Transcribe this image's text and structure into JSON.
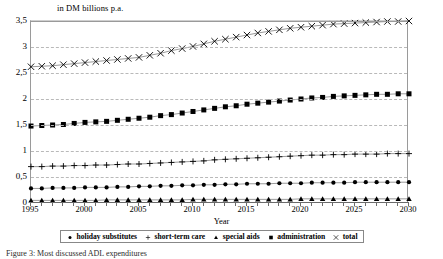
{
  "chart_data": {
    "type": "line",
    "title": "",
    "ylabel": "in DM billions p.a.",
    "xlabel": "Year",
    "ylim": [
      0,
      3.5
    ],
    "xlim": [
      1995,
      2030
    ],
    "ytick_labels": [
      "3,5",
      "3",
      "2,5",
      "2",
      "1,5",
      "1",
      "0,5",
      "0"
    ],
    "ytick_values": [
      3.5,
      3,
      2.5,
      2,
      1.5,
      1,
      0.5,
      0
    ],
    "xtick_labels": [
      "1995",
      "2000",
      "2005",
      "2010",
      "2015",
      "2020",
      "2025",
      "2030"
    ],
    "xtick_values": [
      1995,
      2000,
      2005,
      2010,
      2015,
      2020,
      2025,
      2030
    ],
    "grid": true,
    "legend_position": "bottom",
    "x": [
      1995,
      1996,
      1997,
      1998,
      1999,
      2000,
      2001,
      2002,
      2003,
      2004,
      2005,
      2006,
      2007,
      2008,
      2009,
      2010,
      2011,
      2012,
      2013,
      2014,
      2015,
      2016,
      2017,
      2018,
      2019,
      2020,
      2021,
      2022,
      2023,
      2024,
      2025,
      2026,
      2027,
      2028,
      2029,
      2030
    ],
    "series": [
      {
        "name": "holiday substitutes",
        "marker": "circle",
        "values": [
          0.28,
          0.28,
          0.29,
          0.29,
          0.29,
          0.3,
          0.3,
          0.3,
          0.31,
          0.31,
          0.32,
          0.32,
          0.33,
          0.33,
          0.34,
          0.34,
          0.35,
          0.35,
          0.36,
          0.36,
          0.37,
          0.37,
          0.37,
          0.38,
          0.38,
          0.38,
          0.39,
          0.39,
          0.39,
          0.39,
          0.4,
          0.4,
          0.4,
          0.4,
          0.4,
          0.4
        ]
      },
      {
        "name": "short-term care",
        "marker": "plus",
        "values": [
          0.7,
          0.7,
          0.71,
          0.71,
          0.72,
          0.72,
          0.73,
          0.73,
          0.74,
          0.75,
          0.75,
          0.76,
          0.77,
          0.78,
          0.79,
          0.8,
          0.81,
          0.83,
          0.84,
          0.85,
          0.86,
          0.87,
          0.88,
          0.89,
          0.9,
          0.91,
          0.92,
          0.92,
          0.93,
          0.93,
          0.94,
          0.94,
          0.94,
          0.95,
          0.95,
          0.95
        ]
      },
      {
        "name": "special aids",
        "marker": "triangle",
        "values": [
          0.05,
          0.05,
          0.05,
          0.05,
          0.05,
          0.05,
          0.05,
          0.06,
          0.06,
          0.06,
          0.06,
          0.06,
          0.06,
          0.06,
          0.06,
          0.07,
          0.07,
          0.07,
          0.07,
          0.07,
          0.07,
          0.07,
          0.07,
          0.07,
          0.07,
          0.08,
          0.08,
          0.08,
          0.08,
          0.08,
          0.08,
          0.08,
          0.08,
          0.08,
          0.08,
          0.08
        ]
      },
      {
        "name": "administration",
        "marker": "square",
        "values": [
          1.48,
          1.49,
          1.5,
          1.51,
          1.53,
          1.55,
          1.56,
          1.57,
          1.59,
          1.61,
          1.63,
          1.65,
          1.68,
          1.7,
          1.73,
          1.76,
          1.79,
          1.82,
          1.85,
          1.87,
          1.9,
          1.92,
          1.94,
          1.96,
          1.98,
          2.0,
          2.02,
          2.03,
          2.05,
          2.06,
          2.07,
          2.08,
          2.09,
          2.09,
          2.1,
          2.1
        ]
      },
      {
        "name": "total",
        "marker": "cross",
        "values": [
          2.62,
          2.63,
          2.64,
          2.66,
          2.68,
          2.7,
          2.72,
          2.74,
          2.76,
          2.78,
          2.8,
          2.84,
          2.88,
          2.93,
          2.97,
          3.01,
          3.06,
          3.11,
          3.15,
          3.19,
          3.23,
          3.27,
          3.3,
          3.33,
          3.36,
          3.38,
          3.4,
          3.42,
          3.44,
          3.45,
          3.46,
          3.47,
          3.48,
          3.49,
          3.49,
          3.5
        ]
      }
    ]
  },
  "legend": {
    "items": [
      {
        "label": "holiday substitutes",
        "marker": "circle"
      },
      {
        "label": "short-term care",
        "marker": "plus"
      },
      {
        "label": "special aids",
        "marker": "triangle"
      },
      {
        "label": "administration",
        "marker": "square"
      },
      {
        "label": "total",
        "marker": "cross"
      }
    ]
  },
  "caption": "Figure 3: Most discussed ADL expenditures"
}
